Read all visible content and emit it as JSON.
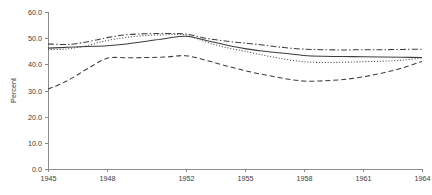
{
  "chart_data": {
    "type": "line",
    "title": "",
    "subtitle": "",
    "xlabel": "",
    "ylabel": "Percent",
    "xlim": [
      1945,
      1964
    ],
    "ylim": [
      0.0,
      60.0
    ],
    "grid": false,
    "legend_position": "none",
    "y_ticks": [
      "60.0",
      "50.0",
      "40.0",
      "30.0",
      "20.0",
      "10.0",
      "0.0"
    ],
    "y_tick_values": [
      60.0,
      50.0,
      40.0,
      30.0,
      20.0,
      10.0,
      0.0
    ],
    "x_ticks": [
      "1945",
      "1948",
      "1952",
      "1955",
      "1958",
      "1961",
      "1964"
    ],
    "x_tick_values": [
      1945,
      1948,
      1952,
      1955,
      1958,
      1961,
      1964
    ],
    "x": [
      1945,
      1946,
      1947,
      1948,
      1949,
      1950,
      1951,
      1952,
      1953,
      1954,
      1955,
      1956,
      1957,
      1958,
      1959,
      1960,
      1961,
      1962,
      1963,
      1964
    ],
    "series": [
      {
        "name": "series-dash-dot",
        "style": "dash-dot",
        "color": "#3d3d3d",
        "values": [
          47.8,
          47.6,
          48.6,
          50.2,
          51.3,
          51.7,
          51.8,
          51.6,
          50.0,
          48.9,
          48.1,
          47.3,
          46.4,
          45.8,
          45.6,
          45.5,
          45.6,
          45.6,
          45.7,
          45.8
        ]
      },
      {
        "name": "series-dotted",
        "style": "dotted",
        "color": "#3d3d3d",
        "values": [
          45.6,
          45.9,
          47.2,
          49.1,
          50.3,
          51.0,
          51.3,
          51.2,
          48.6,
          46.5,
          45.0,
          43.4,
          42.0,
          41.0,
          40.7,
          40.8,
          41.0,
          41.2,
          41.6,
          42.4
        ]
      },
      {
        "name": "series-solid",
        "style": "solid",
        "color": "#3d3d3d",
        "values": [
          46.2,
          46.5,
          46.8,
          47.1,
          47.8,
          48.8,
          49.9,
          50.7,
          49.2,
          47.5,
          46.0,
          45.0,
          44.2,
          43.4,
          43.1,
          43.0,
          42.9,
          42.8,
          42.7,
          42.6
        ]
      },
      {
        "name": "series-dashed",
        "style": "dashed",
        "color": "#3d3d3d",
        "values": [
          30.5,
          33.8,
          38.3,
          42.3,
          42.5,
          42.6,
          42.8,
          43.3,
          41.6,
          39.5,
          37.6,
          36.0,
          34.6,
          33.6,
          33.7,
          34.2,
          35.2,
          36.7,
          38.6,
          41.1
        ]
      }
    ]
  },
  "plot_area": {
    "left": 48,
    "top": 12,
    "right": 422,
    "bottom": 169
  }
}
